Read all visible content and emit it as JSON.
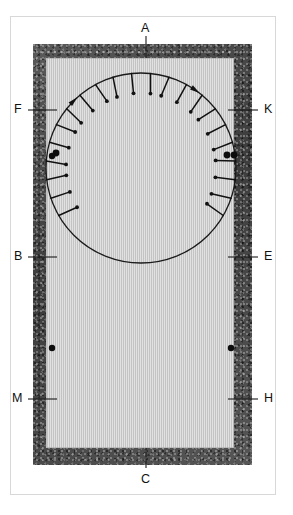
{
  "figure": {
    "diagram_type": "engineering-section-diagram",
    "colors": {
      "wall_fill": "#4a4a4a",
      "panel_fill": "#c9c9c9",
      "line": "#1a1a1a",
      "frame": "#d8d8d8",
      "background": "#ffffff"
    }
  },
  "labels": [
    {
      "key": "A",
      "text": "A",
      "position": "top-center",
      "x": 141,
      "y": 22,
      "leader": {
        "x1": 146,
        "y1": 36,
        "x2": 146,
        "y2": 58
      }
    },
    {
      "key": "F",
      "text": "F",
      "position": "left-upper",
      "x": 14,
      "y": 103,
      "leader": {
        "x1": 28,
        "y1": 110,
        "x2": 57,
        "y2": 110
      }
    },
    {
      "key": "K",
      "text": "K",
      "position": "right-upper",
      "x": 264,
      "y": 103,
      "leader": {
        "x1": 228,
        "y1": 110,
        "x2": 258,
        "y2": 110
      }
    },
    {
      "key": "B",
      "text": "B",
      "position": "left-middle",
      "x": 14,
      "y": 250,
      "leader": {
        "x1": 28,
        "y1": 257,
        "x2": 57,
        "y2": 257
      }
    },
    {
      "key": "E",
      "text": "E",
      "position": "right-middle",
      "x": 264,
      "y": 250,
      "leader": {
        "x1": 228,
        "y1": 257,
        "x2": 258,
        "y2": 257
      }
    },
    {
      "key": "M",
      "text": "M",
      "position": "left-lower",
      "x": 12,
      "y": 392,
      "leader": {
        "x1": 28,
        "y1": 399,
        "x2": 57,
        "y2": 399
      }
    },
    {
      "key": "H",
      "text": "H",
      "position": "right-lower",
      "x": 264,
      "y": 392,
      "leader": {
        "x1": 228,
        "y1": 399,
        "x2": 258,
        "y2": 399
      }
    },
    {
      "key": "C",
      "text": "C",
      "position": "bottom-center",
      "x": 141,
      "y": 473,
      "leader": {
        "x1": 146,
        "y1": 448,
        "x2": 146,
        "y2": 468
      }
    }
  ],
  "circle": {
    "cx": 141,
    "cy": 168,
    "r": 95,
    "direction": "clockwise",
    "arrowheads": [
      {
        "at_angle_deg": -55,
        "x": 206,
        "y": 98
      },
      {
        "at_angle_deg": 225,
        "x": 98,
        "y": 249
      }
    ]
  },
  "anchor_dots": [
    {
      "name": "wall-dot-left-upper",
      "x": 52,
      "y": 156,
      "r": 3.2
    },
    {
      "name": "circle-dot-left-upper",
      "x": 56,
      "y": 153,
      "r": 3.4
    },
    {
      "name": "wall-dot-right-upper",
      "x": 234,
      "y": 155,
      "r": 3.4
    },
    {
      "name": "circle-dot-right-upper",
      "x": 227,
      "y": 155,
      "r": 3.4
    },
    {
      "name": "wall-dot-left-lower",
      "x": 52,
      "y": 348,
      "r": 3.2
    },
    {
      "name": "wall-dot-right-lower",
      "x": 231,
      "y": 348,
      "r": 3.2
    }
  ],
  "pin_marks": {
    "description": "Radial dowel/pin marks with round heads around lower arc of circle",
    "count": 22,
    "angle_start_deg": 150,
    "angle_end_deg": 390,
    "length": 20,
    "head_radius": 1.9
  }
}
